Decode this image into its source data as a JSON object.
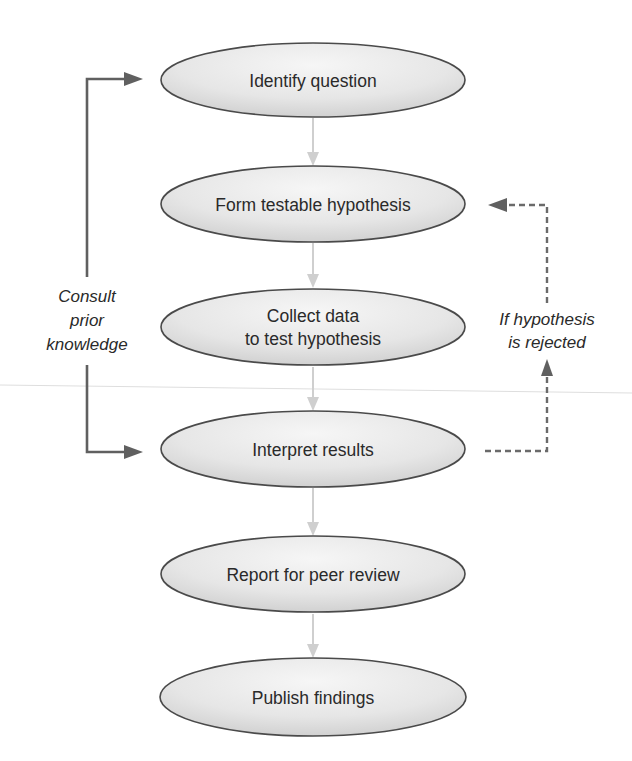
{
  "diagram": {
    "type": "flowchart",
    "colors": {
      "node_fill_light": "#f4f4f4",
      "node_fill_dark": "#d4d4d4",
      "node_stroke": "#4a4a4a",
      "flow_arrow": "#cfcfcf",
      "feedback_arrow": "#606060",
      "text": "#2a2a2a"
    },
    "nodes": [
      {
        "id": "identify",
        "lines": [
          "Identify question"
        ]
      },
      {
        "id": "hypothesis",
        "lines": [
          "Form testable hypothesis"
        ]
      },
      {
        "id": "collect",
        "lines": [
          "Collect data",
          "to test hypothesis"
        ]
      },
      {
        "id": "interpret",
        "lines": [
          "Interpret results"
        ]
      },
      {
        "id": "report",
        "lines": [
          "Report for peer review"
        ]
      },
      {
        "id": "publish",
        "lines": [
          "Publish findings"
        ]
      }
    ],
    "edges": [
      {
        "from": "identify",
        "to": "hypothesis",
        "style": "solid-light"
      },
      {
        "from": "hypothesis",
        "to": "collect",
        "style": "solid-light"
      },
      {
        "from": "collect",
        "to": "interpret",
        "style": "solid-light"
      },
      {
        "from": "interpret",
        "to": "report",
        "style": "solid-light"
      },
      {
        "from": "report",
        "to": "publish",
        "style": "solid-light"
      }
    ],
    "left_loop": {
      "label_lines": [
        "Consult",
        "prior",
        "knowledge"
      ],
      "targets": [
        "identify",
        "interpret"
      ],
      "style": "solid-dark"
    },
    "right_loop": {
      "label_lines": [
        "If hypothesis",
        "is rejected"
      ],
      "from": "interpret",
      "to": "hypothesis",
      "style": "dashed-dark"
    }
  }
}
